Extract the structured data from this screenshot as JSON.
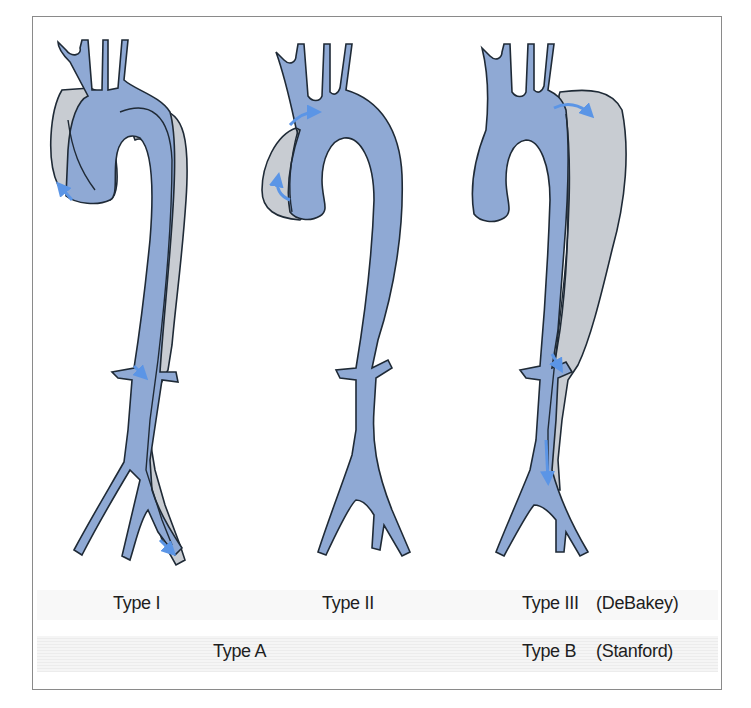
{
  "figure": {
    "colors": {
      "true_lumen": "#8fa9d4",
      "false_lumen": "#c8ccd2",
      "outline": "#1f2a36",
      "flow_arrow": "#5b95e6",
      "caption_band": "#efefef",
      "frame_border": "#8a8a8a"
    },
    "panels": [
      {
        "id": "type-1",
        "label": "Type I",
        "description": "Dissection involving ascending aorta, arch and descending aorta down to iliac arteries"
      },
      {
        "id": "type-2",
        "label": "Type II",
        "description": "Dissection confined to ascending aorta"
      },
      {
        "id": "type-3",
        "label": "Type III",
        "description": "Dissection beginning distal to left subclavian artery, extending into descending aorta"
      }
    ]
  },
  "captions": {
    "row1": {
      "type1": "Type I",
      "type2": "Type II",
      "type3": "Type III",
      "system": "(DeBakey)"
    },
    "row2": {
      "typeA": "Type A",
      "typeB": "Type B",
      "system": "(Stanford)"
    }
  }
}
